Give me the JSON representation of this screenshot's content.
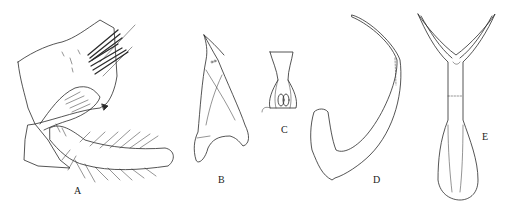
{
  "figure": {
    "background": "#ffffff",
    "stroke_color": "#2a2a2a",
    "panels": [
      {
        "id": "A",
        "label": "A",
        "description": "hypopygium lateral view with gonocoxite, gonostylus and setae"
      },
      {
        "id": "B",
        "label": "B",
        "description": "curved hook-like sclerite"
      },
      {
        "id": "C",
        "label": "C",
        "description": "small symmetrical structure"
      },
      {
        "id": "D",
        "label": "D",
        "description": "long curved J-shaped sclerite"
      },
      {
        "id": "E",
        "label": "E",
        "description": "Y-shaped forked structure with spatulate base"
      }
    ]
  }
}
